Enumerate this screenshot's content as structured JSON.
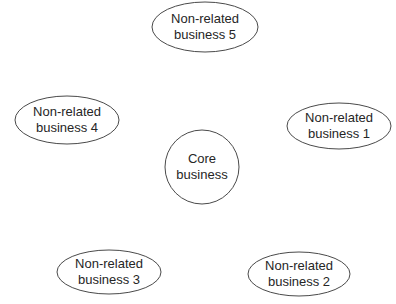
{
  "diagram": {
    "type": "hub-and-spoke",
    "center": {
      "label_line1": "Core",
      "label_line2": "business",
      "shape": "circle",
      "cx": 202,
      "cy": 167,
      "r": 37
    },
    "nodes": [
      {
        "id": "nr5",
        "label_line1": "Non-related",
        "label_line2": "business 5",
        "shape": "ellipse",
        "cx": 205,
        "cy": 27,
        "rx": 53,
        "ry": 25
      },
      {
        "id": "nr4",
        "label_line1": "Non-related",
        "label_line2": "business 4",
        "shape": "ellipse",
        "cx": 67,
        "cy": 120,
        "rx": 52,
        "ry": 24
      },
      {
        "id": "nr1",
        "label_line1": "Non-related",
        "label_line2": "business 1",
        "shape": "ellipse",
        "cx": 339,
        "cy": 126,
        "rx": 52,
        "ry": 23
      },
      {
        "id": "nr3",
        "label_line1": "Non-related",
        "label_line2": "business 3",
        "shape": "ellipse",
        "cx": 109,
        "cy": 272,
        "rx": 52,
        "ry": 22
      },
      {
        "id": "nr2",
        "label_line1": "Non-related",
        "label_line2": "business 2",
        "shape": "ellipse",
        "cx": 299,
        "cy": 274,
        "rx": 51,
        "ry": 22
      }
    ],
    "colors": {
      "stroke": "#4a4a4a",
      "fill": "#ffffff",
      "text": "#262626",
      "background": "#ffffff"
    }
  }
}
